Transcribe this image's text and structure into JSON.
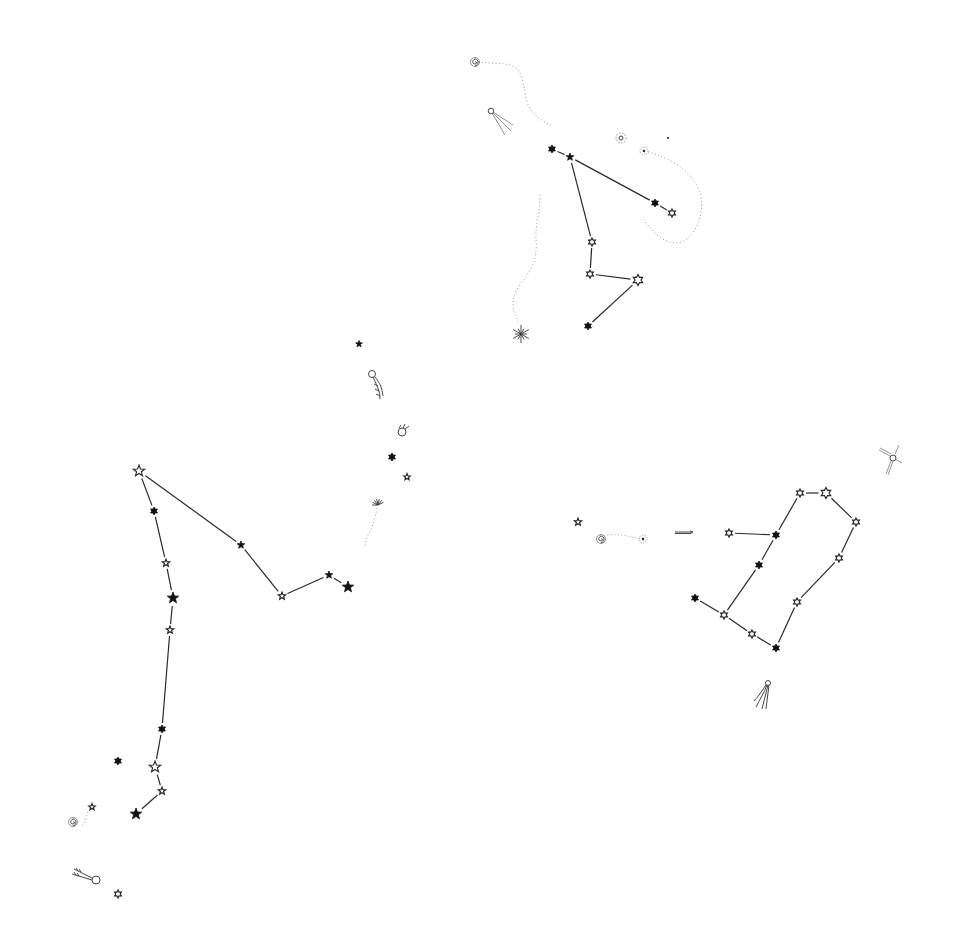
{
  "image": {
    "width": 958,
    "height": 944,
    "background": "#ffffff",
    "ink": "#111111"
  },
  "constellations": [
    {
      "name": "upper-constellation",
      "stars": [
        {
          "id": "u1",
          "x": 552,
          "y": 149,
          "type": "filled6",
          "r": 4
        },
        {
          "id": "u2",
          "x": 570,
          "y": 157,
          "type": "filled5",
          "r": 4
        },
        {
          "id": "u3",
          "x": 655,
          "y": 203,
          "type": "filled6",
          "r": 4
        },
        {
          "id": "u4",
          "x": 672,
          "y": 213,
          "type": "open6",
          "r": 4
        },
        {
          "id": "u5",
          "x": 592,
          "y": 242,
          "type": "open6",
          "r": 4
        },
        {
          "id": "u6",
          "x": 590,
          "y": 274,
          "type": "open6",
          "r": 4
        },
        {
          "id": "u7",
          "x": 638,
          "y": 280,
          "type": "open6",
          "r": 5.5
        },
        {
          "id": "u8",
          "x": 588,
          "y": 326,
          "type": "filled6",
          "r": 4
        }
      ],
      "lines": [
        [
          "u1",
          "u2"
        ],
        [
          "u2",
          "u3"
        ],
        [
          "u3",
          "u4"
        ],
        [
          "u2",
          "u5"
        ],
        [
          "u5",
          "u6"
        ],
        [
          "u6",
          "u7"
        ],
        [
          "u7",
          "u8"
        ]
      ]
    },
    {
      "name": "left-constellation",
      "stars": [
        {
          "id": "l1",
          "x": 139,
          "y": 471,
          "type": "open5",
          "r": 6
        },
        {
          "id": "l2",
          "x": 154,
          "y": 511,
          "type": "filled6",
          "r": 4
        },
        {
          "id": "l3",
          "x": 241,
          "y": 545,
          "type": "filled5",
          "r": 4
        },
        {
          "id": "l4",
          "x": 166,
          "y": 563,
          "type": "open5",
          "r": 4
        },
        {
          "id": "l5",
          "x": 282,
          "y": 596,
          "type": "open5",
          "r": 4
        },
        {
          "id": "l6",
          "x": 329,
          "y": 575,
          "type": "filled5",
          "r": 4
        },
        {
          "id": "l7",
          "x": 348,
          "y": 587,
          "type": "filled5",
          "r": 6
        },
        {
          "id": "l8",
          "x": 173,
          "y": 598,
          "type": "filled5",
          "r": 6
        },
        {
          "id": "l9",
          "x": 170,
          "y": 630,
          "type": "open5",
          "r": 4
        },
        {
          "id": "l10",
          "x": 162,
          "y": 729,
          "type": "filled6",
          "r": 4
        },
        {
          "id": "l11",
          "x": 155,
          "y": 767,
          "type": "open5",
          "r": 6
        },
        {
          "id": "l12",
          "x": 162,
          "y": 791,
          "type": "open5",
          "r": 4
        },
        {
          "id": "l13",
          "x": 136,
          "y": 814,
          "type": "filled5",
          "r": 6
        },
        {
          "id": "l14",
          "x": 118,
          "y": 761,
          "type": "filled6",
          "r": 4
        }
      ],
      "lines": [
        [
          "l1",
          "l2"
        ],
        [
          "l2",
          "l4"
        ],
        [
          "l4",
          "l8"
        ],
        [
          "l8",
          "l9"
        ],
        [
          "l9",
          "l10"
        ],
        [
          "l10",
          "l11"
        ],
        [
          "l11",
          "l12"
        ],
        [
          "l12",
          "l13"
        ],
        [
          "l1",
          "l3"
        ],
        [
          "l3",
          "l5"
        ],
        [
          "l5",
          "l6"
        ],
        [
          "l6",
          "l7"
        ]
      ]
    },
    {
      "name": "right-constellation",
      "stars": [
        {
          "id": "r1",
          "x": 800,
          "y": 493,
          "type": "open6",
          "r": 4
        },
        {
          "id": "r2",
          "x": 826,
          "y": 493,
          "type": "open6",
          "r": 5.5
        },
        {
          "id": "r3",
          "x": 856,
          "y": 522,
          "type": "open6",
          "r": 4
        },
        {
          "id": "r4",
          "x": 839,
          "y": 558,
          "type": "open6",
          "r": 4
        },
        {
          "id": "r5",
          "x": 797,
          "y": 602,
          "type": "open6",
          "r": 4
        },
        {
          "id": "r6",
          "x": 776,
          "y": 648,
          "type": "filled6",
          "r": 4
        },
        {
          "id": "r7",
          "x": 752,
          "y": 634,
          "type": "open6",
          "r": 4
        },
        {
          "id": "r8",
          "x": 724,
          "y": 615,
          "type": "open6",
          "r": 4
        },
        {
          "id": "r9",
          "x": 695,
          "y": 598,
          "type": "filled6",
          "r": 4
        },
        {
          "id": "r10",
          "x": 759,
          "y": 565,
          "type": "filled6",
          "r": 4
        },
        {
          "id": "r11",
          "x": 776,
          "y": 535,
          "type": "filled6",
          "r": 4
        },
        {
          "id": "r12",
          "x": 729,
          "y": 533,
          "type": "open6",
          "r": 4
        }
      ],
      "lines": [
        [
          "r1",
          "r2"
        ],
        [
          "r2",
          "r3"
        ],
        [
          "r3",
          "r4"
        ],
        [
          "r4",
          "r5"
        ],
        [
          "r5",
          "r6"
        ],
        [
          "r6",
          "r7"
        ],
        [
          "r7",
          "r8"
        ],
        [
          "r8",
          "r9"
        ],
        [
          "r8",
          "r10"
        ],
        [
          "r10",
          "r11"
        ],
        [
          "r11",
          "r1"
        ],
        [
          "r12",
          "r11"
        ]
      ]
    }
  ],
  "loose_stars": [
    {
      "x": 359,
      "y": 344,
      "type": "filled5",
      "r": 3.5
    },
    {
      "x": 392,
      "y": 457,
      "type": "filled6",
      "r": 4
    },
    {
      "x": 407,
      "y": 477,
      "type": "open5",
      "r": 3.5
    },
    {
      "x": 578,
      "y": 522,
      "type": "open5",
      "r": 4
    },
    {
      "x": 92,
      "y": 807,
      "type": "open5",
      "r": 3.5
    },
    {
      "x": 118,
      "y": 894,
      "type": "open6",
      "r": 4
    },
    {
      "x": 668,
      "y": 138,
      "type": "dot",
      "r": 1
    }
  ],
  "decorations": [
    {
      "kind": "spiral",
      "name": "spiral-galaxy-top",
      "x": 475,
      "y": 62
    },
    {
      "kind": "comet",
      "name": "comet-upper",
      "x": 491,
      "y": 111,
      "angle": 35
    },
    {
      "kind": "nebula",
      "name": "nebula-upper",
      "x": 621,
      "y": 138
    },
    {
      "kind": "ringed",
      "name": "ringed-object-upper",
      "x": 644,
      "y": 151
    },
    {
      "kind": "burst",
      "name": "starburst-upper",
      "x": 521,
      "y": 334
    },
    {
      "kind": "comet-feather",
      "name": "comet-mid",
      "x": 372,
      "y": 374
    },
    {
      "kind": "jar",
      "name": "small-planet",
      "x": 402,
      "y": 430
    },
    {
      "kind": "burst-small",
      "name": "starburst-mid",
      "x": 378,
      "y": 503
    },
    {
      "kind": "spiral",
      "name": "spiral-galaxy-right",
      "x": 601,
      "y": 539
    },
    {
      "kind": "ringed",
      "name": "ringed-object-right",
      "x": 643,
      "y": 539
    },
    {
      "kind": "streak",
      "name": "meteor-streak",
      "x": 684,
      "y": 532
    },
    {
      "kind": "satellite",
      "name": "satellite",
      "x": 893,
      "y": 458
    },
    {
      "kind": "comet-down",
      "name": "comet-lower-right",
      "x": 768,
      "y": 683
    },
    {
      "kind": "spiral",
      "name": "spiral-galaxy-left",
      "x": 73,
      "y": 822
    },
    {
      "kind": "comet-left",
      "name": "comet-lower-left",
      "x": 96,
      "y": 880
    }
  ],
  "dotted_paths": [
    {
      "name": "trail-top",
      "d": "M478,62 C500,64 510,62 518,70 C525,80 524,95 528,105 C535,118 545,122 552,126"
    },
    {
      "name": "trail-right-loop",
      "d": "M648,152 C670,158 690,170 698,188 C706,205 700,225 690,236 C682,246 668,244 658,236 C650,228 645,222 642,218"
    },
    {
      "name": "trail-left-wave",
      "d": "M540,195 C540,215 535,225 536,240 C538,260 530,272 520,285 C510,298 512,310 518,322"
    },
    {
      "name": "trail-mid",
      "d": "M377,508 C375,520 372,528 368,535 C365,540 366,545 364,548"
    },
    {
      "name": "trail-right-h",
      "d": "M604,536 C615,533 625,535 640,539"
    },
    {
      "name": "trail-left-small",
      "d": "M88,812 C85,818 86,822 82,826"
    }
  ]
}
